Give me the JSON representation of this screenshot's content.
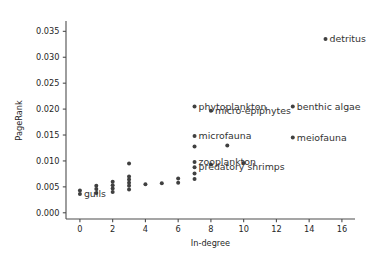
{
  "chart_data": {
    "type": "scatter",
    "title": "",
    "xlabel": "In-degree",
    "ylabel": "PageRank",
    "xlim": [
      -0.85,
      16.8
    ],
    "ylim": [
      -0.0012,
      0.0368
    ],
    "xticks": [
      0,
      2,
      4,
      6,
      8,
      10,
      12,
      14,
      16
    ],
    "xticklabels": [
      "0",
      "2",
      "4",
      "6",
      "8",
      "10",
      "12",
      "14",
      "16"
    ],
    "yticks": [
      0.0,
      0.005,
      0.01,
      0.015,
      0.02,
      0.025,
      0.03,
      0.035
    ],
    "yticklabels": [
      "0.000",
      "0.005",
      "0.010",
      "0.015",
      "0.020",
      "0.025",
      "0.030",
      "0.035"
    ],
    "grid": false,
    "legend": null,
    "marker_color": "#404040",
    "points": [
      {
        "x": 0,
        "y": 0.0036,
        "label": "gulls",
        "label_dx": 4,
        "label_dy": 3
      },
      {
        "x": 0,
        "y": 0.0043,
        "label": null
      },
      {
        "x": 1,
        "y": 0.0038,
        "label": null
      },
      {
        "x": 1,
        "y": 0.0046,
        "label": null
      },
      {
        "x": 1,
        "y": 0.0052,
        "label": null
      },
      {
        "x": 2,
        "y": 0.004,
        "label": null
      },
      {
        "x": 2,
        "y": 0.0047,
        "label": null
      },
      {
        "x": 2,
        "y": 0.0053,
        "label": null
      },
      {
        "x": 2,
        "y": 0.006,
        "label": null
      },
      {
        "x": 3,
        "y": 0.0045,
        "label": null
      },
      {
        "x": 3,
        "y": 0.0052,
        "label": null
      },
      {
        "x": 3,
        "y": 0.0058,
        "label": null
      },
      {
        "x": 3,
        "y": 0.0064,
        "label": null
      },
      {
        "x": 3,
        "y": 0.007,
        "label": null
      },
      {
        "x": 3,
        "y": 0.0095,
        "label": null
      },
      {
        "x": 4,
        "y": 0.0055,
        "label": null
      },
      {
        "x": 5,
        "y": 0.0057,
        "label": null
      },
      {
        "x": 6,
        "y": 0.0058,
        "label": null
      },
      {
        "x": 6,
        "y": 0.0066,
        "label": null
      },
      {
        "x": 7,
        "y": 0.0065,
        "label": null
      },
      {
        "x": 7,
        "y": 0.0076,
        "label": null
      },
      {
        "x": 7,
        "y": 0.0088,
        "label": "predatory shrimps",
        "label_dx": 4,
        "label_dy": 3
      },
      {
        "x": 7,
        "y": 0.0098,
        "label": "zooplankton",
        "label_dx": 4,
        "label_dy": 3
      },
      {
        "x": 7,
        "y": 0.0128,
        "label": null
      },
      {
        "x": 7,
        "y": 0.0148,
        "label": "microfauna",
        "label_dx": 4,
        "label_dy": 3
      },
      {
        "x": 7,
        "y": 0.0205,
        "label": "phytoplankton",
        "label_dx": 4,
        "label_dy": 3
      },
      {
        "x": 8,
        "y": 0.0093,
        "label": null
      },
      {
        "x": 8,
        "y": 0.0197,
        "label": "micro-epiphytes",
        "label_dx": 4,
        "label_dy": 3
      },
      {
        "x": 9,
        "y": 0.013,
        "label": null
      },
      {
        "x": 10,
        "y": 0.0096,
        "label": null
      },
      {
        "x": 13,
        "y": 0.0145,
        "label": "meiofauna",
        "label_dx": 4,
        "label_dy": 3
      },
      {
        "x": 13,
        "y": 0.0205,
        "label": "benthic algae",
        "label_dx": 4,
        "label_dy": 3
      },
      {
        "x": 15,
        "y": 0.0335,
        "label": "detritus",
        "label_dx": 4,
        "label_dy": 3
      }
    ]
  }
}
